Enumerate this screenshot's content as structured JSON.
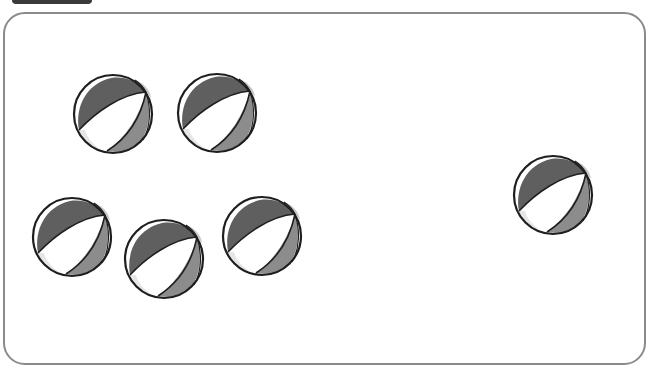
{
  "scene": {
    "description": "Counting picture: beach balls in a rounded frame",
    "groups": [
      {
        "name": "left-group",
        "count": 5
      },
      {
        "name": "right-group",
        "count": 1
      }
    ],
    "balls": [
      {
        "id": 1,
        "cx": 113,
        "cy": 114
      },
      {
        "id": 2,
        "cx": 217,
        "cy": 113
      },
      {
        "id": 3,
        "cx": 72,
        "cy": 237
      },
      {
        "id": 4,
        "cx": 164,
        "cy": 259
      },
      {
        "id": 5,
        "cx": 262,
        "cy": 236
      },
      {
        "id": 6,
        "cx": 553,
        "cy": 195
      }
    ],
    "colors": {
      "frame": "#8a8a8a",
      "dark_panel": "#5f5f5f",
      "mid_panel": "#8c8c8c",
      "light_panel": "#e6e6e6",
      "outline": "#1e1e1e"
    }
  }
}
